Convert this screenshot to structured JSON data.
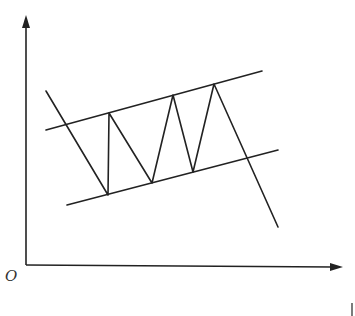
{
  "diagram": {
    "type": "price-channel-breakout",
    "origin_label": "O",
    "colors": {
      "background": "#ffffff",
      "line": "#222222"
    },
    "axes": {
      "origin": [
        26,
        265
      ],
      "y_axis_top": [
        26,
        15
      ],
      "x_axis_end": [
        343,
        267
      ]
    },
    "channel": {
      "upper_line": {
        "from": [
          46,
          130
        ],
        "to": [
          262,
          71
        ]
      },
      "lower_line": {
        "from": [
          67,
          205
        ],
        "to": [
          278,
          150
        ]
      }
    },
    "price_path": [
      [
        46,
        91
      ],
      [
        108,
        195
      ],
      [
        109,
        113
      ],
      [
        152,
        183
      ],
      [
        173,
        95
      ],
      [
        193,
        172
      ],
      [
        214,
        84
      ],
      [
        278,
        227
      ]
    ]
  }
}
